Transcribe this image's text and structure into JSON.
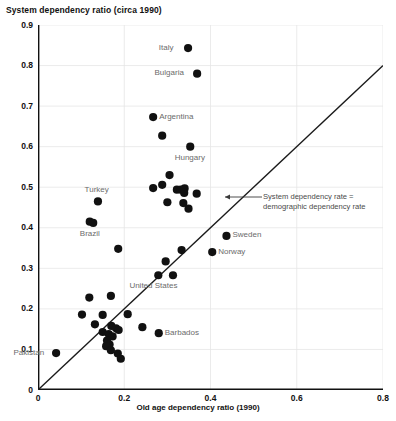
{
  "chart_data": {
    "type": "scatter",
    "title": "System dependency ratio (circa 1990)",
    "xlabel": "Old age dependency ratio (1990)",
    "ylabel": "",
    "xlim": [
      0,
      0.8
    ],
    "ylim": [
      0,
      0.9
    ],
    "xticks": [
      "0",
      "0.2",
      "0.4",
      "0.6",
      "0.8"
    ],
    "xtick_values": [
      0,
      0.2,
      0.4,
      0.6,
      0.8
    ],
    "yticks": [
      "0",
      "0.1",
      "0.2",
      "0.3",
      "0.4",
      "0.5",
      "0.6",
      "0.7",
      "0.8",
      "0.9"
    ],
    "ytick_values": [
      0,
      0.1,
      0.2,
      0.3,
      0.4,
      0.5,
      0.6,
      0.7,
      0.8,
      0.9
    ],
    "grid": true,
    "grid_color": "#e6e6e6",
    "marker_color": "#111111",
    "marker_size": 5,
    "reference_line": {
      "label": "System dependency rate = demographic dependency rate",
      "from": [
        0,
        0
      ],
      "to": [
        0.8,
        0.8
      ],
      "color": "#1a1a1a"
    },
    "annotation": {
      "line1": "System dependency rate =",
      "line2": "demographic dependency rate",
      "arrow": "left-arrow"
    },
    "points": [
      {
        "x": 0.348,
        "y": 0.843,
        "label": "Italy",
        "label_pos": "left"
      },
      {
        "x": 0.369,
        "y": 0.78,
        "label": "Bulgaria",
        "label_pos": "left"
      },
      {
        "x": 0.267,
        "y": 0.673,
        "label": "Argentina",
        "label_pos": "right"
      },
      {
        "x": 0.288,
        "y": 0.627,
        "label": null
      },
      {
        "x": 0.353,
        "y": 0.6,
        "label": "Hungary",
        "label_pos": "below"
      },
      {
        "x": 0.305,
        "y": 0.53,
        "label": null
      },
      {
        "x": 0.267,
        "y": 0.498,
        "label": null
      },
      {
        "x": 0.288,
        "y": 0.506,
        "label": null
      },
      {
        "x": 0.322,
        "y": 0.494,
        "label": null
      },
      {
        "x": 0.331,
        "y": 0.494,
        "label": null
      },
      {
        "x": 0.34,
        "y": 0.497,
        "label": null
      },
      {
        "x": 0.339,
        "y": 0.486,
        "label": null
      },
      {
        "x": 0.368,
        "y": 0.484,
        "label": null
      },
      {
        "x": 0.3,
        "y": 0.463,
        "label": null
      },
      {
        "x": 0.337,
        "y": 0.461,
        "label": null
      },
      {
        "x": 0.349,
        "y": 0.447,
        "label": null
      },
      {
        "x": 0.139,
        "y": 0.465,
        "label": "Turkey",
        "label_pos": "above"
      },
      {
        "x": 0.12,
        "y": 0.415,
        "label": null
      },
      {
        "x": 0.128,
        "y": 0.412,
        "label": "Brazil",
        "label_pos": "below"
      },
      {
        "x": 0.186,
        "y": 0.348,
        "label": null
      },
      {
        "x": 0.437,
        "y": 0.38,
        "label": "Sweden",
        "label_pos": "right"
      },
      {
        "x": 0.404,
        "y": 0.34,
        "label": "Norway",
        "label_pos": "right"
      },
      {
        "x": 0.333,
        "y": 0.345,
        "label": null
      },
      {
        "x": 0.296,
        "y": 0.317,
        "label": null
      },
      {
        "x": 0.279,
        "y": 0.283,
        "label": "United States",
        "label_pos": "below"
      },
      {
        "x": 0.313,
        "y": 0.283,
        "label": null
      },
      {
        "x": 0.169,
        "y": 0.232,
        "label": null
      },
      {
        "x": 0.119,
        "y": 0.228,
        "label": null
      },
      {
        "x": 0.28,
        "y": 0.14,
        "label": "Barbados",
        "label_pos": "right"
      },
      {
        "x": 0.15,
        "y": 0.185,
        "label": null
      },
      {
        "x": 0.208,
        "y": 0.187,
        "label": null
      },
      {
        "x": 0.102,
        "y": 0.186,
        "label": null
      },
      {
        "x": 0.242,
        "y": 0.155,
        "label": null
      },
      {
        "x": 0.132,
        "y": 0.162,
        "label": null
      },
      {
        "x": 0.17,
        "y": 0.158,
        "label": null
      },
      {
        "x": 0.181,
        "y": 0.152,
        "label": null
      },
      {
        "x": 0.187,
        "y": 0.148,
        "label": null
      },
      {
        "x": 0.15,
        "y": 0.143,
        "label": null
      },
      {
        "x": 0.164,
        "y": 0.138,
        "label": null
      },
      {
        "x": 0.173,
        "y": 0.132,
        "label": null
      },
      {
        "x": 0.16,
        "y": 0.122,
        "label": null
      },
      {
        "x": 0.166,
        "y": 0.112,
        "label": null
      },
      {
        "x": 0.158,
        "y": 0.108,
        "label": null
      },
      {
        "x": 0.169,
        "y": 0.098,
        "label": null
      },
      {
        "x": 0.185,
        "y": 0.09,
        "label": null
      },
      {
        "x": 0.192,
        "y": 0.077,
        "label": null
      },
      {
        "x": 0.042,
        "y": 0.091,
        "label": "Pakistan",
        "label_pos": "left"
      }
    ]
  }
}
